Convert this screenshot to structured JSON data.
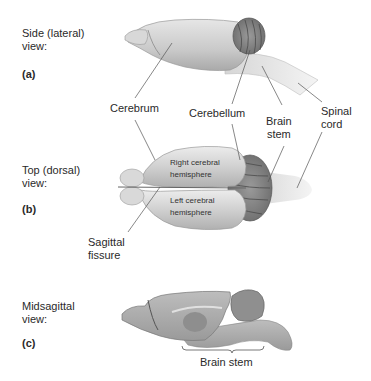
{
  "views": [
    {
      "id": "a",
      "title_line1": "Side (lateral)",
      "title_line2": "view:",
      "letter": "(a)"
    },
    {
      "id": "b",
      "title_line1": "Top (dorsal)",
      "title_line2": "view:",
      "letter": "(b)"
    },
    {
      "id": "c",
      "title_line1": "Midsagittal",
      "title_line2": "view:",
      "letter": "(c)"
    }
  ],
  "labels": {
    "cerebrum": "Cerebrum",
    "cerebellum": "Cerebellum",
    "brain_stem_line1": "Brain",
    "brain_stem_line2": "stem",
    "spinal_cord_line1": "Spinal",
    "spinal_cord_line2": "cord",
    "sagittal_line1": "Sagittal",
    "sagittal_line2": "fissure",
    "right_hemisphere_line1": "Right cerebral",
    "right_hemisphere_line2": "hemisphere",
    "left_hemisphere_line1": "Left cerebral",
    "left_hemisphere_line2": "hemisphere",
    "brain_stem_bracket": "Brain stem"
  },
  "colors": {
    "brain_fill": "#cfcfcf",
    "cerebellum_fill": "#8a8a8a",
    "leader_line": "#555555",
    "text": "#2a2a2a"
  }
}
